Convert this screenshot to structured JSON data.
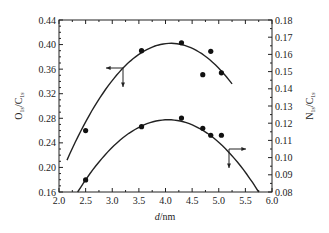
{
  "chart_data": {
    "type": "scatter",
    "title": "",
    "xlabel": "d/nm",
    "ylabel": "O1s/C1s",
    "ylabel_right": "N1s/C1s",
    "xlim": [
      2.0,
      6.0
    ],
    "ylim": [
      0.16,
      0.44
    ],
    "ylim_right": [
      0.08,
      0.18
    ],
    "x_ticks": [
      "2.0",
      "2.5",
      "3.0",
      "3.5",
      "4.0",
      "4.5",
      "5.0",
      "5.5",
      "6.0"
    ],
    "y_ticks_left": [
      "0.16",
      "0.20",
      "0.24",
      "0.28",
      "0.32",
      "0.36",
      "0.40",
      "0.44"
    ],
    "y_ticks_right": [
      "0.08",
      "0.09",
      "0.10",
      "0.11",
      "0.12",
      "0.13",
      "0.14",
      "0.15",
      "0.16",
      "0.17",
      "0.18"
    ],
    "grid": false,
    "legend": "none (arrows indicate axis: upper curve → left axis, lower curve → right axis)",
    "series": [
      {
        "name": "O1s/C1s",
        "axis": "left",
        "points": [
          {
            "x": 2.5,
            "y": 0.26
          },
          {
            "x": 3.55,
            "y": 0.39
          },
          {
            "x": 4.3,
            "y": 0.403
          },
          {
            "x": 4.7,
            "y": 0.351
          },
          {
            "x": 4.85,
            "y": 0.389
          },
          {
            "x": 5.05,
            "y": 0.354
          }
        ],
        "fit_curve": {
          "x_start": 2.15,
          "x_end": 5.25,
          "peak_x": 4.1,
          "peak_y": 0.402
        }
      },
      {
        "name": "N1s/C1s",
        "axis": "right",
        "points": [
          {
            "x": 2.5,
            "y": 0.087
          },
          {
            "x": 3.55,
            "y": 0.118
          },
          {
            "x": 4.3,
            "y": 0.123
          },
          {
            "x": 4.7,
            "y": 0.117
          },
          {
            "x": 4.85,
            "y": 0.113
          },
          {
            "x": 5.05,
            "y": 0.113
          }
        ],
        "fit_curve": {
          "x_start": 2.35,
          "x_end": 5.75,
          "peak_x": 4.05,
          "peak_y": 0.122
        }
      }
    ]
  },
  "labels": {
    "xlabel_italic": "d",
    "xlabel_unit": "/nm",
    "ylabel_left_main": "O",
    "ylabel_left_sub1": "1s",
    "ylabel_left_mid": "/C",
    "ylabel_left_sub2": "1s",
    "ylabel_right_main": "N",
    "ylabel_right_sub1": "1s",
    "ylabel_right_mid": "/C",
    "ylabel_right_sub2": "1s"
  }
}
